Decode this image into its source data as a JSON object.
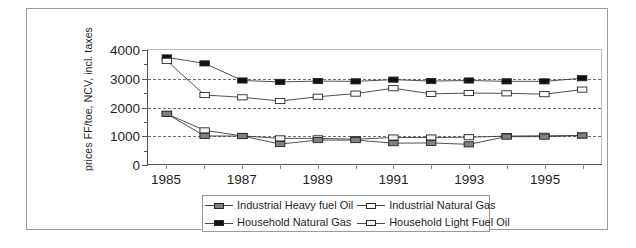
{
  "chart_data": {
    "type": "line",
    "title": "",
    "xlabel": "",
    "ylabel": "prices FF/toe, NCV, incl. taxes",
    "x": [
      1985,
      1986,
      1987,
      1988,
      1989,
      1990,
      1991,
      1992,
      1993,
      1994,
      1995,
      1996
    ],
    "xtick_labels": [
      "1985",
      "",
      "1987",
      "",
      "1989",
      "",
      "1991",
      "",
      "1993",
      "",
      "1995",
      ""
    ],
    "xlim": [
      1984.5,
      1996.5
    ],
    "ylim": [
      0,
      4000
    ],
    "ytick_labels": [
      "0",
      "1000",
      "2000",
      "3000",
      "4000"
    ],
    "ytick_values": [
      0,
      1000,
      2000,
      3000,
      4000
    ],
    "yminor_values": [
      500,
      1500,
      2500,
      3500
    ],
    "gridlines": [
      1000,
      2000,
      3000
    ],
    "grid": "horizontal-dashed",
    "legend_position": "below-center",
    "series": [
      {
        "name": "Industrial Heavy fuel Oil",
        "marker": "filled-grey-square",
        "color": "#808080",
        "values": [
          1760,
          985,
          980,
          700,
          840,
          840,
          730,
          740,
          690,
          960,
          960,
          1000
        ]
      },
      {
        "name": "Industrial Natural Gas",
        "marker": "open-white-square",
        "color": "#ffffff",
        "values": [
          3620,
          2420,
          2340,
          2210,
          2360,
          2470,
          2660,
          2460,
          2490,
          2480,
          2450,
          2610
        ]
      },
      {
        "name": "Household Natural Gas",
        "marker": "filled-black-square",
        "color": "#111111",
        "values": [
          3740,
          3530,
          2930,
          2880,
          2910,
          2900,
          2960,
          2910,
          2930,
          2900,
          2900,
          3010
        ]
      },
      {
        "name": "Household Light Fuel Oil",
        "marker": "open-light-square",
        "color": "#f2f2f2",
        "values": [
          1760,
          1180,
          985,
          900,
          900,
          870,
          930,
          930,
          940,
          980,
          990,
          1000
        ]
      }
    ]
  },
  "legend": {
    "items": [
      {
        "label": "Industrial Heavy fuel Oil"
      },
      {
        "label": "Industrial Natural Gas"
      },
      {
        "label": "Household Natural Gas"
      },
      {
        "label": "Household Light Fuel Oil"
      }
    ]
  }
}
